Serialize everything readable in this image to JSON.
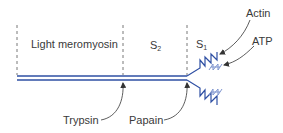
{
  "diagram": {
    "regions": [
      {
        "id": "lmm",
        "label": "Light meromyosin"
      },
      {
        "id": "s2",
        "label": "S",
        "subscript": "2"
      },
      {
        "id": "s1",
        "label": "S",
        "subscript": "1"
      }
    ],
    "cleavage_sites": [
      {
        "enzyme": "Trypsin"
      },
      {
        "enzyme": "Papain"
      }
    ],
    "binding_sites": [
      {
        "ligand": "Actin"
      },
      {
        "ligand": "ATP"
      }
    ],
    "colors": {
      "chain": "#2e4fa3",
      "chain_light": "#7f95cf",
      "dashed": "#555555",
      "arrow": "#333333",
      "text": "#3a3a3a"
    }
  }
}
